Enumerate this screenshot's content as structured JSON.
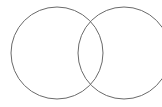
{
  "diagram": {
    "type": "venn",
    "background": "#ffffff",
    "stroke_color": "#6a6a6a",
    "stroke_width": 1,
    "circles": [
      {
        "name": "left-circle",
        "cx": 57,
        "cy": 53,
        "r": 46
      },
      {
        "name": "right-circle",
        "cx": 124,
        "cy": 53,
        "r": 46,
        "clipped_right": true
      }
    ],
    "labels": []
  }
}
